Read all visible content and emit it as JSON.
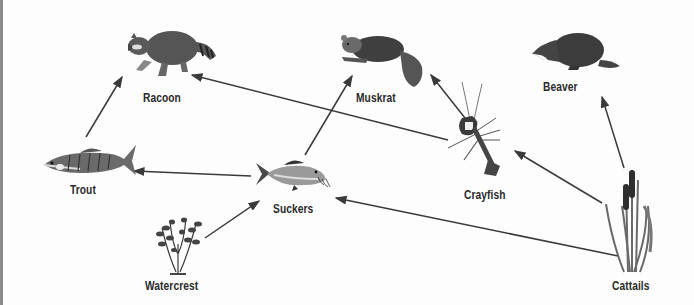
{
  "diagram": {
    "type": "food-web",
    "organisms": [
      {
        "id": "racoon",
        "label": "Racoon"
      },
      {
        "id": "muskrat",
        "label": "Muskrat"
      },
      {
        "id": "beaver",
        "label": "Beaver"
      },
      {
        "id": "trout",
        "label": "Trout"
      },
      {
        "id": "suckers",
        "label": "Suckers"
      },
      {
        "id": "crayfish",
        "label": "Crayfish"
      },
      {
        "id": "watercrest",
        "label": "Watercrest"
      },
      {
        "id": "cattails",
        "label": "Cattails"
      }
    ],
    "arrows": [
      {
        "from": "Trout",
        "to": "Racoon"
      },
      {
        "from": "Crayfish",
        "to": "Racoon"
      },
      {
        "from": "Suckers",
        "to": "Muskrat"
      },
      {
        "from": "Crayfish",
        "to": "Muskrat"
      },
      {
        "from": "Suckers",
        "to": "Trout"
      },
      {
        "from": "Watercrest",
        "to": "Suckers"
      },
      {
        "from": "Cattails",
        "to": "Suckers"
      },
      {
        "from": "Cattails",
        "to": "Crayfish"
      },
      {
        "from": "Cattails",
        "to": "Beaver"
      }
    ],
    "colors": {
      "arrow": "#3a3a3a",
      "label": "#2a2a2a",
      "animal": "#4a4a4a",
      "border": "#8a8a8a"
    }
  }
}
